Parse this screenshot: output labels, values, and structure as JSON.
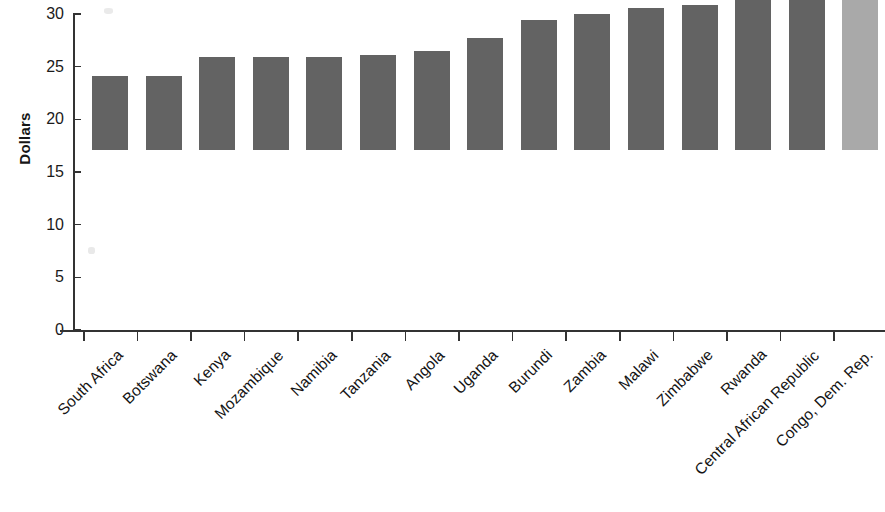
{
  "chart_data": {
    "type": "bar",
    "title": "",
    "subtitle": "",
    "xlabel": "",
    "ylabel": "Dollars",
    "ylim": [
      0,
      30
    ],
    "ytick_values": [
      0,
      5,
      10,
      15,
      20,
      25,
      30
    ],
    "ytick_labels": [
      "0",
      "5",
      "10",
      "15",
      "20",
      "25",
      "30"
    ],
    "grid": false,
    "legend": null,
    "orientation": "vertical",
    "categories": [
      "South Africa",
      "Botswana",
      "Kenya",
      "Mozambique",
      "Namibia",
      "Tanzania",
      "Angola",
      "Uganda",
      "Burundi",
      "Zambia",
      "Malawi",
      "Zimbabwe",
      "Rwanda",
      "Central African Republic",
      "Congo, Dem. Rep."
    ],
    "values": [
      7.0,
      7.0,
      8.8,
      8.8,
      8.8,
      9.0,
      9.4,
      10.6,
      12.3,
      12.9,
      13.5,
      13.8,
      16.2,
      20.3,
      25.3
    ],
    "bar_colors": [
      "#636363",
      "#636363",
      "#636363",
      "#636363",
      "#636363",
      "#636363",
      "#636363",
      "#636363",
      "#636363",
      "#636363",
      "#636363",
      "#636363",
      "#636363",
      "#636363",
      "#a9a9a9"
    ],
    "highlight_category": "Congo, Dem. Rep.",
    "highlight_color": "#a9a9a9",
    "default_color": "#636363"
  },
  "axes": {
    "y_title": "Dollars",
    "axis_color": "#333333",
    "background": "#ffffff"
  }
}
